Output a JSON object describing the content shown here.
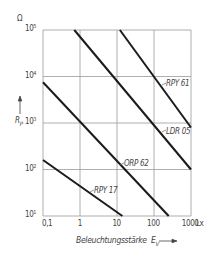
{
  "chart_data": {
    "type": "line",
    "xscale": "log",
    "yscale": "log",
    "title": "",
    "xlabel": "Beleuchtungsstärke",
    "xlabel_symbol": "E",
    "xlabel_subscript": "V",
    "x_unit": "Lx",
    "ylabel": "R",
    "ylabel_subscript": "P",
    "y_unit": "Ω",
    "xlim": [
      0.1,
      1000
    ],
    "ylim": [
      10,
      100000
    ],
    "x_ticks": [
      "0,1",
      "1",
      "10",
      "100",
      "1000"
    ],
    "y_ticks": [
      {
        "base": "10",
        "exp": "5"
      },
      {
        "base": "10",
        "exp": "4"
      },
      {
        "base": "10",
        "exp": "3"
      },
      {
        "base": "10",
        "exp": "2"
      },
      {
        "base": "10",
        "exp": "1"
      }
    ],
    "grid": true,
    "legend": "inline labels",
    "series": [
      {
        "name": "RPY 61",
        "x": [
          12,
          1000
        ],
        "y": [
          100000,
          800
        ]
      },
      {
        "name": "LDR 05",
        "x": [
          0.7,
          1000
        ],
        "y": [
          100000,
          100
        ]
      },
      {
        "name": "ORP 62",
        "x": [
          0.1,
          250
        ],
        "y": [
          7500,
          10
        ]
      },
      {
        "name": "RPY 17",
        "x": [
          0.1,
          14
        ],
        "y": [
          160,
          10
        ]
      }
    ]
  }
}
